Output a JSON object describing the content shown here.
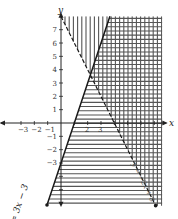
{
  "chart_data": {
    "type": "inequality-graph",
    "title": "",
    "xlabel": "x",
    "ylabel": "y",
    "xlim": [
      -3.5,
      7.6
    ],
    "ylim": [
      -6.2,
      8.0
    ],
    "x_ticks": [
      -3,
      -2,
      -1,
      1,
      2,
      3,
      4,
      5,
      6,
      7
    ],
    "x_tick_labels": [
      "−3",
      "−2",
      "−1",
      "",
      "2",
      "3",
      "",
      "",
      "",
      ""
    ],
    "y_ticks": [
      -5,
      -4,
      -3,
      -2,
      -1,
      1,
      2,
      3,
      4,
      5,
      6,
      7
    ],
    "y_tick_labels": [
      "",
      "",
      "−3",
      "−2",
      "−1",
      "1",
      "2",
      "3",
      "4",
      "5",
      "6",
      "7"
    ],
    "lines": [
      {
        "name": "solid-line",
        "equation": "y = 3x − 3",
        "slope": 3,
        "intercept": -3,
        "style": "solid",
        "x_range": [
          -1.05,
          3.67
        ]
      },
      {
        "name": "dashed-line",
        "equation": "y = −2x + 8",
        "slope": -2,
        "intercept": 8,
        "style": "dashed",
        "x_range": [
          0,
          7.1
        ]
      }
    ],
    "shading": [
      {
        "name": "vertical-hatch",
        "inequality": "y > −2x + 8",
        "pattern": "vertical"
      },
      {
        "name": "horizontal-hatch",
        "inequality": "y ≤ 3x − 3",
        "pattern": "horizontal"
      }
    ],
    "labels": {
      "solid": "y = 3x − 3",
      "dashed": "y = −2x + 8"
    },
    "colors": {
      "line": "#1a1a1a",
      "hatch": "#555555",
      "axis": "#222222"
    }
  }
}
